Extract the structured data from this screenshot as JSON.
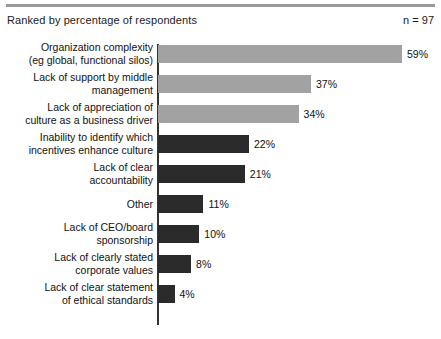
{
  "header": {
    "title": "Ranked by percentage of respondents",
    "sample_size": "n = 97"
  },
  "colors": {
    "bar_light": "#a2a2a2",
    "bar_dark": "#2b2b2b",
    "axis": "#333333",
    "rule": "#9a9a9a",
    "text": "#111111",
    "background": "#ffffff"
  },
  "chart_data": {
    "type": "bar",
    "orientation": "horizontal",
    "title": "Ranked by percentage of respondents",
    "subtitle": "n = 97",
    "xlabel": "",
    "ylabel": "",
    "xlim": [
      0,
      59
    ],
    "grid": false,
    "legend": null,
    "value_suffix": "%",
    "categories": [
      "Organization complexity\n(eg global, functional silos)",
      "Lack of support by middle\nmanagement",
      "Lack of appreciation of\nculture as a business driver",
      "Inability to identify which\nincentives enhance culture",
      "Lack of clear\naccountability",
      "Other",
      "Lack of CEO/board\nsponsorship",
      "Lack of clearly stated\ncorporate values",
      "Lack of clear statement\nof ethical standards"
    ],
    "values": [
      59,
      37,
      34,
      22,
      21,
      11,
      10,
      8,
      4
    ],
    "value_labels": [
      "59%",
      "37%",
      "34%",
      "22%",
      "21%",
      "11%",
      "10%",
      "8%",
      "4%"
    ],
    "bar_colors": [
      "light",
      "light",
      "light",
      "dark",
      "dark",
      "dark",
      "dark",
      "dark",
      "dark"
    ]
  }
}
